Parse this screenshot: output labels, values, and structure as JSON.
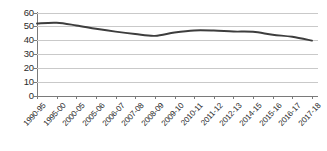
{
  "chart_data": {
    "type": "line",
    "title": "",
    "subtitle": "",
    "xlabel": "",
    "ylabel": "",
    "grid": true,
    "legend": false,
    "legend_position": "none",
    "ylim": [
      0,
      60
    ],
    "yticks": [
      0,
      10,
      20,
      30,
      40,
      50,
      60
    ],
    "ytick_labels": [
      "0",
      "10",
      "20",
      "30",
      "40",
      "50",
      "60"
    ],
    "categories": [
      "1990-95",
      "1995-00",
      "2000-05",
      "2005-06",
      "2006-07",
      "2007-08",
      "2008-09",
      "2009-10",
      "2010-11",
      "2011-12",
      "2012-13",
      "2014-15",
      "2015-16",
      "2016-17",
      "2017-18"
    ],
    "series": [
      {
        "name": "series-1",
        "color": "#3d3d3d",
        "values": [
          52.4,
          52.9,
          51.0,
          48.6,
          46.5,
          44.8,
          43.5,
          45.9,
          47.4,
          47.3,
          46.6,
          46.4,
          44.3,
          42.8,
          40.0
        ]
      }
    ]
  },
  "colors": {
    "series_line": "#3d3d3d",
    "gridline": "#c9c9c9",
    "axis": "#7a7a7a",
    "text": "#2b2b2b",
    "background": "#ffffff"
  }
}
